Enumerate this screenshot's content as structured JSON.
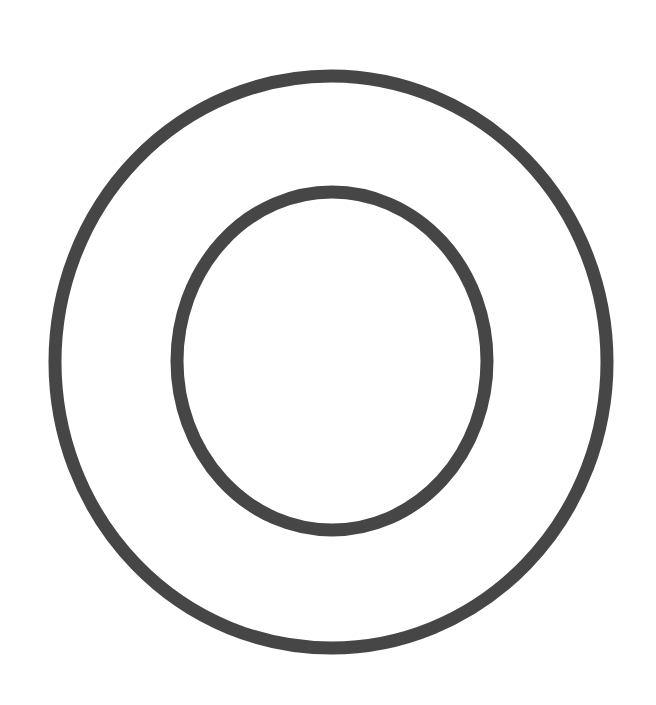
{
  "canvas": {
    "width": 656,
    "height": 705,
    "background": "#ffffff"
  },
  "diagram": {
    "stroke_color": "#464646",
    "shapes": [
      {
        "id": "outer-ring",
        "type": "ellipse",
        "cx": 331,
        "cy": 362,
        "rx": 276,
        "ry": 286,
        "stroke_width": 13
      },
      {
        "id": "inner-ring",
        "type": "ellipse",
        "cx": 332,
        "cy": 361,
        "rx": 155,
        "ry": 169,
        "stroke_width": 13
      }
    ]
  }
}
